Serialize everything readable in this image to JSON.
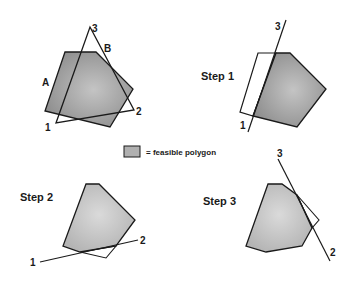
{
  "panels": {
    "original": {
      "labels": {
        "a": "A",
        "b": "B",
        "v1": "1",
        "v2": "2",
        "v3": "3"
      }
    },
    "step1": {
      "title": "Step 1",
      "labels": {
        "v1": "1",
        "v3": "3"
      }
    },
    "step2": {
      "title": "Step 2",
      "labels": {
        "v1": "1",
        "v2": "2"
      }
    },
    "step3": {
      "title": "Step 3",
      "labels": {
        "v2": "2",
        "v3": "3"
      }
    }
  },
  "legend": {
    "text": "= feasible polygon",
    "swatch_color": "#b0b0b0"
  },
  "colors": {
    "fill_dark": "#9a9a9a",
    "fill_light": "#c8c8c8",
    "stroke": "#1a1a1a"
  }
}
